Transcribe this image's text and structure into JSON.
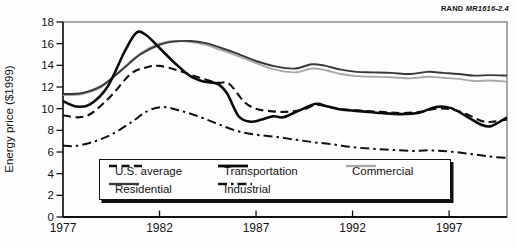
{
  "branding": {
    "label_bold": "RAND",
    "label_italic": "MR1616-2.4"
  },
  "axes": {
    "y_title": "Energy price ($1999)",
    "y_ticks": [
      0,
      2,
      4,
      6,
      8,
      10,
      12,
      14,
      16,
      18
    ],
    "x_ticks": [
      1977,
      1982,
      1987,
      1992,
      1997
    ],
    "x_range": [
      1977,
      2000
    ],
    "y_range": [
      0,
      18
    ]
  },
  "legend": {
    "items": [
      {
        "id": "us_average",
        "label": "U.S. average"
      },
      {
        "id": "transportation",
        "label": "Transportation"
      },
      {
        "id": "commercial",
        "label": "Commercial"
      },
      {
        "id": "residential",
        "label": "Residential"
      },
      {
        "id": "industrial",
        "label": "Industrial"
      }
    ]
  },
  "chart_data": {
    "type": "line",
    "title": "",
    "xlabel": "",
    "ylabel": "Energy price ($1999)",
    "xlim": [
      1977,
      2000
    ],
    "ylim": [
      0,
      18
    ],
    "grid": false,
    "legend_position": "bottom-inside-box",
    "series": [
      {
        "id": "commercial",
        "name": "Commercial",
        "color": "#a8a8a8",
        "dash": "",
        "width": 1.9,
        "points": [
          [
            1977,
            11.25
          ],
          [
            1978,
            11.35
          ],
          [
            1979,
            12.0
          ],
          [
            1980,
            13.6
          ],
          [
            1981,
            15.1
          ],
          [
            1982,
            16.0
          ],
          [
            1982.8,
            16.25
          ],
          [
            1983.6,
            16.15
          ],
          [
            1984.4,
            15.9
          ],
          [
            1985.2,
            15.4
          ],
          [
            1986,
            14.9
          ],
          [
            1987,
            14.2
          ],
          [
            1988,
            13.6
          ],
          [
            1989,
            13.35
          ],
          [
            1989.9,
            13.7
          ],
          [
            1990.6,
            13.55
          ],
          [
            1991.4,
            13.2
          ],
          [
            1992.2,
            13.0
          ],
          [
            1993,
            12.95
          ],
          [
            1994,
            12.9
          ],
          [
            1995,
            12.8
          ],
          [
            1995.9,
            12.95
          ],
          [
            1996.7,
            12.85
          ],
          [
            1997.5,
            12.75
          ],
          [
            1998.3,
            12.55
          ],
          [
            1999.1,
            12.6
          ],
          [
            2000,
            12.5
          ]
        ]
      },
      {
        "id": "residential",
        "name": "Residential",
        "color": "#383838",
        "dash": "",
        "width": 1.9,
        "points": [
          [
            1977,
            11.35
          ],
          [
            1978,
            11.45
          ],
          [
            1979,
            12.1
          ],
          [
            1980,
            13.5
          ],
          [
            1981,
            15.0
          ],
          [
            1982,
            15.9
          ],
          [
            1982.8,
            16.2
          ],
          [
            1983.6,
            16.25
          ],
          [
            1984.4,
            16.05
          ],
          [
            1985.2,
            15.6
          ],
          [
            1986,
            15.1
          ],
          [
            1987,
            14.4
          ],
          [
            1988,
            13.9
          ],
          [
            1989,
            13.7
          ],
          [
            1989.9,
            14.1
          ],
          [
            1990.6,
            13.95
          ],
          [
            1991.4,
            13.6
          ],
          [
            1992.2,
            13.4
          ],
          [
            1993,
            13.35
          ],
          [
            1994,
            13.3
          ],
          [
            1995,
            13.2
          ],
          [
            1995.9,
            13.4
          ],
          [
            1996.7,
            13.3
          ],
          [
            1997.5,
            13.2
          ],
          [
            1998.3,
            13.05
          ],
          [
            1999.1,
            13.1
          ],
          [
            2000,
            13.05
          ]
        ]
      },
      {
        "id": "industrial",
        "name": "Industrial",
        "color": "#101010",
        "dash": "9 4 2.5 4",
        "width": 2,
        "points": [
          [
            1977,
            6.6
          ],
          [
            1977.6,
            6.55
          ],
          [
            1978.5,
            6.9
          ],
          [
            1979.5,
            7.6
          ],
          [
            1980.5,
            8.7
          ],
          [
            1981.4,
            9.8
          ],
          [
            1982.2,
            10.15
          ],
          [
            1983,
            9.85
          ],
          [
            1984,
            9.3
          ],
          [
            1985,
            8.6
          ],
          [
            1986,
            7.95
          ],
          [
            1987,
            7.6
          ],
          [
            1988,
            7.4
          ],
          [
            1989,
            7.15
          ],
          [
            1990,
            6.9
          ],
          [
            1991,
            6.7
          ],
          [
            1992,
            6.45
          ],
          [
            1993,
            6.3
          ],
          [
            1994,
            6.2
          ],
          [
            1995,
            6.1
          ],
          [
            1996,
            6.15
          ],
          [
            1997,
            6.05
          ],
          [
            1998,
            5.85
          ],
          [
            1999,
            5.6
          ],
          [
            2000,
            5.45
          ]
        ]
      },
      {
        "id": "us_average",
        "name": "U.S. average",
        "color": "#101010",
        "dash": "8 4.5",
        "width": 2.1,
        "points": [
          [
            1977,
            9.4
          ],
          [
            1977.8,
            9.2
          ],
          [
            1978.5,
            9.6
          ],
          [
            1979.5,
            11.2
          ],
          [
            1980.5,
            13.2
          ],
          [
            1981.3,
            13.8
          ],
          [
            1982,
            13.95
          ],
          [
            1983,
            13.5
          ],
          [
            1984,
            12.9
          ],
          [
            1985,
            12.4
          ],
          [
            1985.6,
            12.3
          ],
          [
            1986.4,
            10.6
          ],
          [
            1987,
            10.0
          ],
          [
            1987.6,
            9.8
          ],
          [
            1988.5,
            9.7
          ],
          [
            1989.4,
            9.9
          ],
          [
            1990.1,
            10.35
          ],
          [
            1990.7,
            10.2
          ],
          [
            1991.5,
            9.95
          ],
          [
            1992.5,
            9.8
          ],
          [
            1993.5,
            9.7
          ],
          [
            1994.5,
            9.6
          ],
          [
            1995.5,
            9.7
          ],
          [
            1996.3,
            10.0
          ],
          [
            1997.1,
            9.95
          ],
          [
            1997.9,
            9.5
          ],
          [
            1998.7,
            8.85
          ],
          [
            1999.3,
            8.8
          ],
          [
            2000,
            9.0
          ]
        ]
      },
      {
        "id": "transportation",
        "name": "Transportation",
        "color": "#0b0b0b",
        "dash": "",
        "width": 2.6,
        "points": [
          [
            1977,
            10.7
          ],
          [
            1977.7,
            10.2
          ],
          [
            1978.4,
            10.4
          ],
          [
            1979.3,
            12.0
          ],
          [
            1980.2,
            15.3
          ],
          [
            1980.8,
            17.0
          ],
          [
            1981.3,
            16.8
          ],
          [
            1982,
            15.6
          ],
          [
            1982.8,
            14.2
          ],
          [
            1983.6,
            13.0
          ],
          [
            1984.3,
            12.5
          ],
          [
            1985,
            12.3
          ],
          [
            1985.5,
            11.4
          ],
          [
            1986.1,
            9.3
          ],
          [
            1986.7,
            8.8
          ],
          [
            1987.3,
            9.0
          ],
          [
            1987.9,
            9.3
          ],
          [
            1988.4,
            9.2
          ],
          [
            1989.2,
            9.8
          ],
          [
            1990.1,
            10.45
          ],
          [
            1990.7,
            10.2
          ],
          [
            1991.5,
            9.9
          ],
          [
            1992.5,
            9.75
          ],
          [
            1993.5,
            9.6
          ],
          [
            1994.5,
            9.5
          ],
          [
            1995.5,
            9.65
          ],
          [
            1996.3,
            10.15
          ],
          [
            1997.1,
            10.05
          ],
          [
            1997.9,
            9.3
          ],
          [
            1998.7,
            8.5
          ],
          [
            1999.2,
            8.4
          ],
          [
            2000,
            9.2
          ]
        ]
      }
    ]
  }
}
